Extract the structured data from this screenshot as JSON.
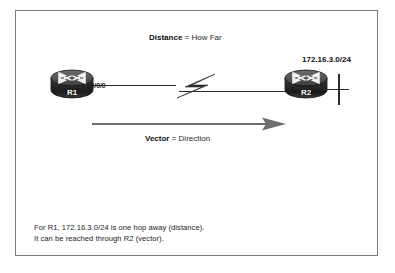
{
  "figure": {
    "kind": "network-topology-diagram",
    "background_color": "#ffffff",
    "border_color": "#7a7a80"
  },
  "labels": {
    "distance": {
      "term": "Distance",
      "definition": " = How Far"
    },
    "vector": {
      "term": "Vector",
      "definition": " = Direction"
    }
  },
  "nodes": [
    {
      "id": "r1",
      "name": "R1",
      "icon": "router-icon"
    },
    {
      "id": "r2",
      "name": "R2",
      "icon": "router-icon"
    }
  ],
  "interfaces": {
    "r1_serial": "S0/0/0"
  },
  "networks": {
    "lan_r2": "172.16.3.0/24"
  },
  "caption": {
    "line1": "For R1, 172.16.3.0/24 is one hop away (distance).",
    "line2": "It can be reached through R2 (vector)."
  },
  "colors": {
    "router_body_dark": "#1c1c1c",
    "router_body_mid": "#4a4a4a",
    "link_black": "#2b2b2b",
    "vector_arrow_gray": "#6e6e6e",
    "text_black": "#1b1b1b"
  }
}
